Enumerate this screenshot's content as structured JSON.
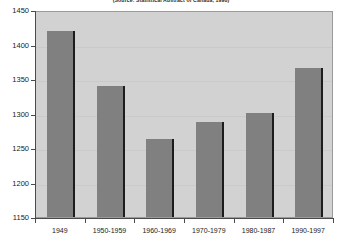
{
  "chart_data": {
    "type": "bar",
    "title": "(Source: Statistical Abstract of Canada, 1998)",
    "xlabel": "",
    "ylabel": "",
    "categories": [
      "1949",
      "1950-1959",
      "1960-1969",
      "1970-1979",
      "1980-1987",
      "1990-1997"
    ],
    "values": [
      1419,
      1340,
      1263,
      1288,
      1301,
      1366
    ],
    "ylim": [
      1150,
      1450
    ],
    "ytick_labels": [
      "1450",
      "1400",
      "1350",
      "1300",
      "1250",
      "1200",
      "1150"
    ],
    "ytick_values": [
      1450,
      1400,
      1350,
      1300,
      1250,
      1200,
      1150
    ],
    "grid": true,
    "legend": "none",
    "series": [
      {
        "name": "series-1",
        "values": [
          1419,
          1340,
          1263,
          1288,
          1301,
          1366
        ]
      }
    ],
    "colors": {
      "bar_fill": "#808080",
      "bar_edge": "#1c1c1c",
      "plot_background": "#d2d2d2",
      "axis": "#4a4a4a",
      "text": "#1a1a1a",
      "page_background": "#ffffff"
    }
  }
}
